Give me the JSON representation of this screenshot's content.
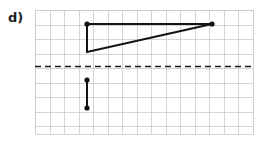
{
  "figure": {
    "label": "d)",
    "caption_label_name": "part-label-d"
  },
  "colors": {
    "grid_line": "#c9c9cf",
    "grid_line_minor": "#d8d8de",
    "shape_stroke": "#141414",
    "dashed_axis": "#1a1a1a",
    "vertex_dot": "#111111",
    "background": "#ffffff",
    "label_text": "#1d1d1d"
  },
  "grid": {
    "x_start": 35,
    "y_start": 10,
    "x_end": 253,
    "y_end": 134,
    "cell_size": 14.53,
    "columns": 15,
    "rows": 8.5,
    "line_width": 0.8
  },
  "chart_data": {
    "type": "scatter",
    "title": "",
    "xlabel": "",
    "ylabel": "",
    "grid": true,
    "legend": "none",
    "xlim": [
      35,
      253
    ],
    "ylim": [
      134,
      10
    ],
    "annotations": [
      {
        "name": "mirror-line",
        "kind": "dashed-horizontal-line",
        "y": 66.5,
        "x_from": 35,
        "x_to": 253,
        "dash": "6,4",
        "width": 1.6
      }
    ],
    "series": [
      {
        "name": "triangle",
        "kind": "polygon-open",
        "closed": true,
        "stroke_width": 2.0,
        "points": [
          {
            "x": 87,
            "y": 24
          },
          {
            "x": 212,
            "y": 24
          },
          {
            "x": 87,
            "y": 52
          }
        ],
        "vertex_markers": [
          {
            "x": 87,
            "y": 24,
            "r": 2.6
          },
          {
            "x": 212,
            "y": 24,
            "r": 2.6
          }
        ]
      },
      {
        "name": "lower-segment",
        "kind": "line-segment",
        "stroke_width": 2.0,
        "points": [
          {
            "x": 87,
            "y": 80
          },
          {
            "x": 87,
            "y": 108
          }
        ],
        "vertex_markers": [
          {
            "x": 87,
            "y": 80,
            "r": 2.6
          },
          {
            "x": 87,
            "y": 108,
            "r": 2.6
          }
        ]
      }
    ]
  }
}
